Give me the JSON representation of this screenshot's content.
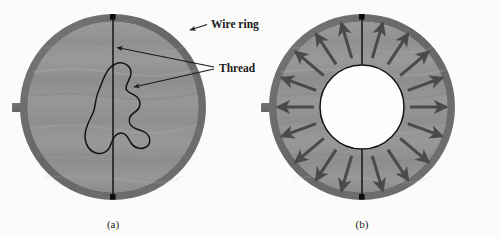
{
  "figure": {
    "type": "physics-diagram",
    "background_color": "#fbfbfa",
    "labels": {
      "wire_ring": "Wire ring",
      "thread": "Thread"
    },
    "captions": {
      "panel_a": "(a)",
      "panel_b": "(b)"
    },
    "colors": {
      "ring_band": "#6e6e6e",
      "ring_band_dark": "#5e5e5e",
      "film_fill": "#939393",
      "film_fill_light": "#9c9c9c",
      "inner_hole": "#fdfdfb",
      "thread_line": "#141414",
      "arrow": "#4a4a4a",
      "handle": "#6e6e6e",
      "text": "#1a1a1a"
    },
    "panel_a": {
      "caption": "(a)",
      "center": {
        "x": 113,
        "y": 107
      },
      "outer_radius": 93,
      "ring_thickness": 8,
      "handle": {
        "x": 12,
        "y": 103,
        "width": 30,
        "height": 9
      },
      "thread_top_anchor": {
        "x": 113,
        "y": 16
      },
      "thread_bottom_anchor": {
        "x": 113,
        "y": 198
      },
      "loop_shape": "irregular-closed-curve",
      "anchor_dots": 2
    },
    "panel_b": {
      "caption": "(b)",
      "center": {
        "x": 362,
        "y": 107
      },
      "outer_radius": 93,
      "ring_thickness": 8,
      "inner_hole_radius": 42,
      "handle": {
        "x": 261,
        "y": 103,
        "width": 30,
        "height": 9
      },
      "thread_top_anchor": {
        "x": 362,
        "y": 16
      },
      "thread_bottom_anchor": {
        "x": 362,
        "y": 198
      },
      "loop_shape": "circle",
      "arrow_count": 16,
      "arrow_direction": "radially-outward",
      "arrow_inner_radius": 46,
      "arrow_outer_radius": 82,
      "anchor_dots": 2
    },
    "annotations": [
      {
        "name": "wire-ring-callout",
        "text": "Wire ring",
        "text_x": 209,
        "text_y": 27,
        "leader_from": {
          "x": 206,
          "y": 24
        },
        "leader_to": {
          "x": 188,
          "y": 31
        },
        "has_arrowhead": true
      },
      {
        "name": "thread-callout",
        "text": "Thread",
        "text_x": 219,
        "text_y": 71,
        "leader_lines": [
          {
            "from": {
              "x": 216,
              "y": 68
            },
            "to": {
              "x": 115,
              "y": 47
            }
          },
          {
            "from": {
              "x": 216,
              "y": 69
            },
            "to": {
              "x": 151,
              "y": 86
            }
          }
        ],
        "has_arrowhead": true
      }
    ]
  }
}
